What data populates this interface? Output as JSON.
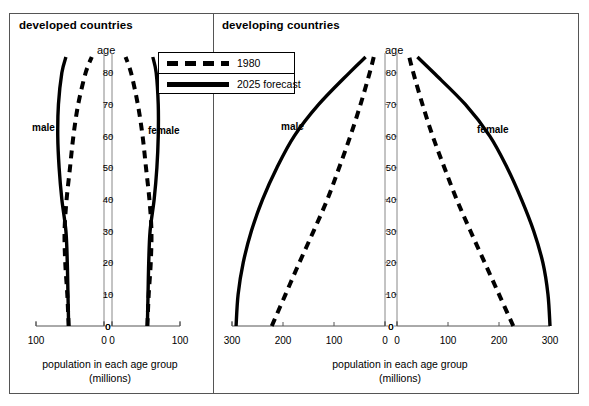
{
  "figure": {
    "panels": [
      {
        "id": "developed",
        "title": "developed countries",
        "age_axis_label": "age",
        "male_label": "male",
        "female_label": "female",
        "x_caption_line1": "population in each age group",
        "x_caption_line2": "(millions)",
        "x_ticks_male": [
          "100",
          "0"
        ],
        "x_ticks_female": [
          "0",
          "100"
        ],
        "y_ticks": [
          "0",
          "10",
          "20",
          "30",
          "40",
          "50",
          "60",
          "70",
          "80"
        ],
        "center_zero_label": "0"
      },
      {
        "id": "developing",
        "title": "developing countries",
        "age_axis_label": "age",
        "male_label": "male",
        "female_label": "female",
        "x_caption_line1": "population in each age group",
        "x_caption_line2": "(millions)",
        "x_ticks_male": [
          "300",
          "200",
          "100",
          "0"
        ],
        "x_ticks_female": [
          "0",
          "100",
          "200",
          "300"
        ],
        "y_ticks": [
          "0",
          "10",
          "20",
          "30",
          "40",
          "50",
          "60",
          "70",
          "80"
        ],
        "center_zero_label": "0"
      }
    ],
    "legend": {
      "position": "top-center",
      "entries": [
        {
          "label": "1980",
          "style": "dashed"
        },
        {
          "label": "2025 forecast",
          "style": "solid"
        }
      ]
    },
    "colors": {
      "line": "#000000",
      "frame": "#555555",
      "axis": "#888888",
      "background": "#ffffff"
    }
  },
  "chart_data": {
    "type": "line",
    "subtitle": "1980 and 2025 forecast population pyramids",
    "xlabel": "population in each age group (millions)",
    "ylabel": "age",
    "grid": false,
    "legend_position": "top-center",
    "ages": [
      0,
      10,
      20,
      30,
      40,
      50,
      60,
      70,
      80,
      85
    ],
    "panels": [
      {
        "name": "developed countries",
        "xlim_male": [
          100,
          0
        ],
        "xlim_female": [
          0,
          100
        ],
        "ylim": [
          0,
          85
        ],
        "series": [
          {
            "name": "1980",
            "side": "male",
            "style": "dashed",
            "values": [
              52,
              54,
              57,
              58,
              55,
              50,
              45,
              38,
              27,
              18
            ]
          },
          {
            "name": "2025 forecast",
            "side": "male",
            "style": "solid",
            "values": [
              52,
              53,
              54,
              56,
              62,
              66,
              68,
              67,
              62,
              56
            ]
          },
          {
            "name": "1980",
            "side": "female",
            "style": "dashed",
            "values": [
              52,
              54,
              57,
              58,
              55,
              50,
              45,
              38,
              28,
              20
            ]
          },
          {
            "name": "2025 forecast",
            "side": "female",
            "style": "solid",
            "values": [
              52,
              53,
              54,
              56,
              62,
              66,
              68,
              68,
              65,
              60
            ]
          }
        ]
      },
      {
        "name": "developing countries",
        "xlim_male": [
          300,
          0
        ],
        "xlim_female": [
          0,
          300
        ],
        "ylim": [
          0,
          85
        ],
        "series": [
          {
            "name": "1980",
            "side": "male",
            "style": "dashed",
            "values": [
              222,
              195,
              168,
              140,
              113,
              90,
              68,
              48,
              30,
              22
            ]
          },
          {
            "name": "2025 forecast",
            "side": "male",
            "style": "solid",
            "values": [
              292,
              288,
              278,
              262,
              240,
              212,
              178,
              130,
              70,
              38
            ]
          },
          {
            "name": "1980",
            "side": "female",
            "style": "dashed",
            "values": [
              228,
              200,
              172,
              144,
              117,
              93,
              70,
              50,
              32,
              24
            ]
          },
          {
            "name": "2025 forecast",
            "side": "female",
            "style": "solid",
            "values": [
              300,
              296,
              286,
              268,
              244,
              216,
              182,
              134,
              72,
              40
            ]
          }
        ]
      }
    ]
  }
}
